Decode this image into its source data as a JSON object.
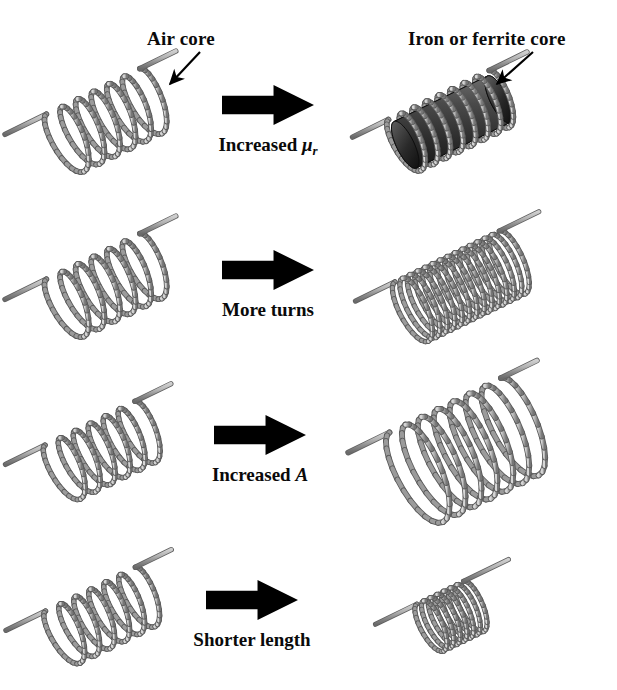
{
  "figure": {
    "background_color": "#ffffff",
    "wire_color": "#9a9a9a",
    "wire_dark": "#6e6e6e",
    "wire_light": "#d2d2d2",
    "core_color": "#3a3a3a",
    "arrow_color": "#000000",
    "text_color": "#0a0a0a"
  },
  "callouts": [
    {
      "id": "air-core",
      "text": "Air core",
      "x": 147,
      "y": 28,
      "pointer": "arrow-down-left"
    },
    {
      "id": "iron-core",
      "text": "Iron or ferrite core",
      "x": 408,
      "y": 28,
      "pointer": "arrow-down-left"
    }
  ],
  "rows": [
    {
      "id": "row-permeability",
      "transition_label": "Increased ",
      "symbol": "μ",
      "symbol_sub": "r",
      "symbol_style": "italic-greek-with-subscript",
      "left_coil": {
        "name": "air-core-coil",
        "turns": 6,
        "radius": 34,
        "length": 104,
        "has_core": false
      },
      "right_coil": {
        "name": "iron-core-coil",
        "turns": 8,
        "radius": 30,
        "length": 112,
        "has_core": true,
        "core_label": "iron or ferrite core"
      }
    },
    {
      "id": "row-turns",
      "transition_label": "More turns",
      "symbol": "",
      "symbol_sub": "",
      "symbol_style": "none",
      "left_coil": {
        "name": "few-turns-coil",
        "turns": 6,
        "radius": 34,
        "length": 104,
        "has_core": false
      },
      "right_coil": {
        "name": "many-turns-coil",
        "turns": 14,
        "radius": 34,
        "length": 116,
        "has_core": false
      }
    },
    {
      "id": "row-area",
      "transition_label": "Increased ",
      "symbol": "A",
      "symbol_sub": "",
      "symbol_style": "italic",
      "left_coil": {
        "name": "small-area-coil",
        "turns": 6,
        "radius": 32,
        "length": 100,
        "has_core": false
      },
      "right_coil": {
        "name": "large-area-coil",
        "turns": 7,
        "radius": 52,
        "length": 124,
        "has_core": false
      }
    },
    {
      "id": "row-length",
      "transition_label": "Shorter length",
      "symbol": "",
      "symbol_sub": "",
      "symbol_style": "none",
      "left_coil": {
        "name": "long-coil",
        "turns": 6,
        "radius": 31,
        "length": 100,
        "has_core": false
      },
      "right_coil": {
        "name": "short-coil",
        "turns": 7,
        "radius": 27,
        "length": 52,
        "has_core": false
      }
    }
  ],
  "arrows": [
    {
      "id": "arrow-row-1",
      "x": 222,
      "y": 85,
      "width": 92,
      "height": 40
    },
    {
      "id": "arrow-row-2",
      "x": 222,
      "y": 250,
      "width": 92,
      "height": 40
    },
    {
      "id": "arrow-row-3",
      "x": 214,
      "y": 415,
      "width": 92,
      "height": 40
    },
    {
      "id": "arrow-row-4",
      "x": 206,
      "y": 580,
      "width": 92,
      "height": 40
    }
  ],
  "mid_labels": [
    {
      "id": "label-row-1",
      "cx": 268,
      "y": 134
    },
    {
      "id": "label-row-2",
      "cx": 268,
      "y": 299
    },
    {
      "id": "label-row-3",
      "cx": 260,
      "y": 464
    },
    {
      "id": "label-row-4",
      "cx": 252,
      "y": 629
    }
  ]
}
